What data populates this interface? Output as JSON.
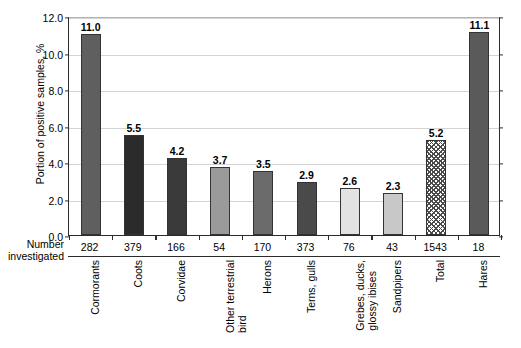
{
  "chart_data": {
    "type": "bar",
    "title": "",
    "xlabel": "",
    "ylabel": "Portion of positive samples, %",
    "ylim": [
      0.0,
      12.0
    ],
    "ytick_labels": [
      "0.0",
      "2.0",
      "4.0",
      "6.0",
      "8.0",
      "10.0",
      "12.0"
    ],
    "ytick_values": [
      0.0,
      2.0,
      4.0,
      6.0,
      8.0,
      10.0,
      12.0
    ],
    "grid": true,
    "legend": "none",
    "row_header": "Number\ninvestigated",
    "row_header_line1": "Number",
    "row_header_line2": "investigated",
    "categories": [
      "Cormorants",
      "Coots",
      "Corvidae",
      "Other terrestrial\nbird",
      "Herons",
      "Terns, gulls",
      "Grebes, ducks,\nglossy ibises",
      "Sandpipers",
      "Total",
      "Hares"
    ],
    "values": [
      11.0,
      5.5,
      4.2,
      3.7,
      3.5,
      2.9,
      2.6,
      2.3,
      5.2,
      11.1
    ],
    "value_labels": [
      "11.0",
      "5.5",
      "4.2",
      "3.7",
      "3.5",
      "2.9",
      "2.6",
      "2.3",
      "5.2",
      "11.1"
    ],
    "number_investigated": [
      282,
      379,
      166,
      54,
      170,
      373,
      76,
      43,
      1543,
      18
    ],
    "number_investigated_labels": [
      "282",
      "379",
      "166",
      "54",
      "170",
      "373",
      "76",
      "43",
      "1543",
      "18"
    ],
    "bar_fills": [
      "#5f5f5f",
      "#2b2b2b",
      "#3a3a3a",
      "#9a9a9a",
      "#6b6b6b",
      "#4a4a4a",
      "#e2e2e2",
      "#c8c8c8",
      "crosshatch",
      "#5a5a5a"
    ],
    "bar_edge_color": "#333333",
    "axis_color": "#2b2b2b",
    "gridline_color": "#d4d4d4",
    "background_color": "#ffffff"
  }
}
